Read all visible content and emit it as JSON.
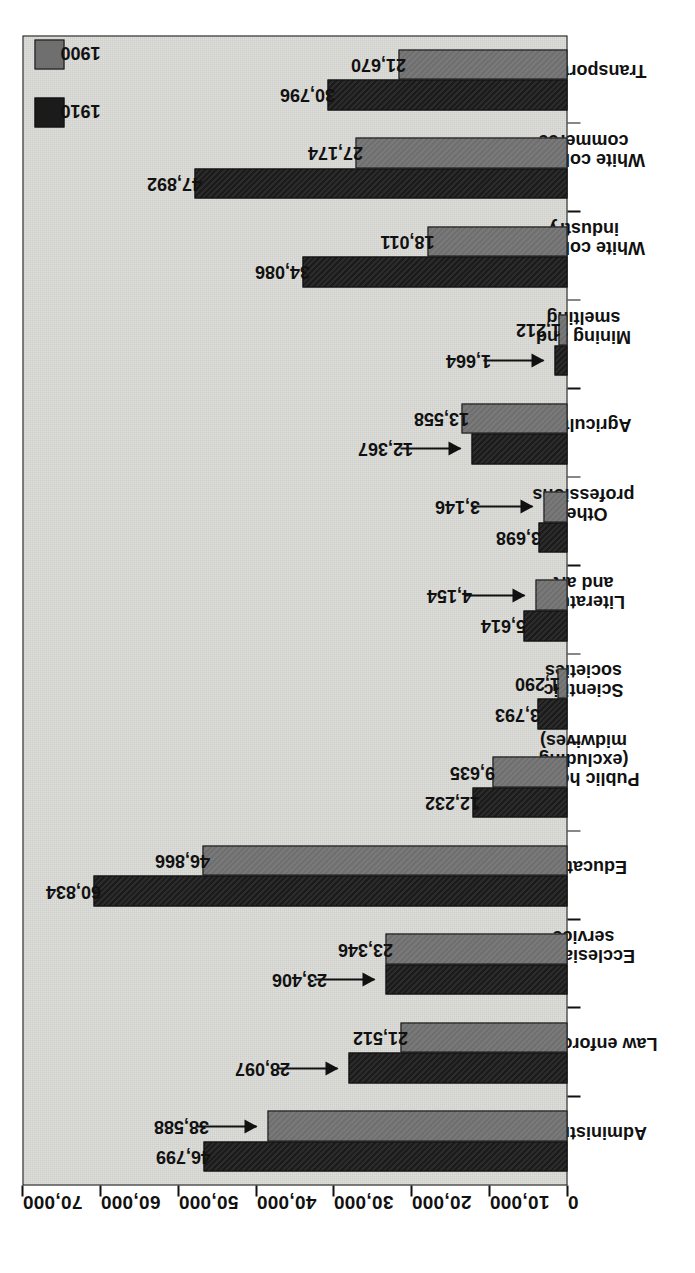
{
  "legend": {
    "position": "top-left-rotated",
    "entries": [
      {
        "label": "1900",
        "color": "#6f6f6f"
      },
      {
        "label": "1910",
        "color": "#1b1b1b"
      }
    ]
  },
  "axis": {
    "value_ticks": [
      "0",
      "10,000",
      "20,000",
      "30,000",
      "40,000",
      "50,000",
      "60,000",
      "70,000"
    ]
  },
  "chart_data": {
    "type": "bar",
    "title": "",
    "subtitle": "",
    "xlabel": "",
    "ylabel": "",
    "ylim": [
      0,
      70000
    ],
    "grid": false,
    "orientation": "grouped-vertical-rotated",
    "legend_position": "top-left",
    "categories": [
      "Administration",
      "Law enforcement",
      "Ecclesiastic\nservice",
      "Education",
      "Public health\n(excluding midwives)",
      "Scientific\nsocieties",
      "Literature\nand art",
      "Other\nprofessions",
      "Agriculture",
      "Mining and\nsmelting",
      "White collar in\nindustry",
      "White collar in\ncommerce",
      "Transportation"
    ],
    "series": [
      {
        "name": "1900",
        "color": "#6f6f6f",
        "values": [
          38588,
          21512,
          23346,
          46866,
          9635,
          1290,
          4154,
          3146,
          13558,
          1212,
          18011,
          27174,
          21670
        ],
        "labels": [
          "38,588",
          "21,512",
          "23,346",
          "46,866",
          "9,635",
          "1,290",
          "4,154",
          "3,146",
          "13,558",
          "1,212",
          "18,011",
          "27,174",
          "21,670"
        ]
      },
      {
        "name": "1910",
        "color": "#1b1b1b",
        "values": [
          46799,
          28097,
          23406,
          60834,
          12232,
          3793,
          5614,
          3698,
          12367,
          1664,
          34086,
          47892,
          30796
        ],
        "labels": [
          "46,799",
          "28,097",
          "23,406",
          "60,834",
          "12,232",
          "3,793",
          "5,614",
          "3,698",
          "12,367",
          "1,664",
          "34,086",
          "47,892",
          "30,796"
        ]
      }
    ],
    "annotations": [
      {
        "category": "Administration",
        "series": "1900",
        "label": "38,588",
        "style": "leader-arrow"
      },
      {
        "category": "Law enforcement",
        "series": "1910",
        "label": "28,097",
        "style": "leader-arrow"
      },
      {
        "category": "Ecclesiastic service",
        "series": "1910",
        "label": "23,406",
        "style": "leader-arrow"
      },
      {
        "category": "Literature and art",
        "series": "1900",
        "label": "4,154",
        "style": "leader-arrow"
      },
      {
        "category": "Other professions",
        "series": "1900",
        "label": "3,146",
        "style": "leader-arrow"
      },
      {
        "category": "Agriculture",
        "series": "1910",
        "label": "12,367",
        "style": "leader-arrow"
      },
      {
        "category": "Mining and smelting",
        "series": "1910",
        "label": "1,664",
        "style": "leader-arrow"
      }
    ]
  }
}
